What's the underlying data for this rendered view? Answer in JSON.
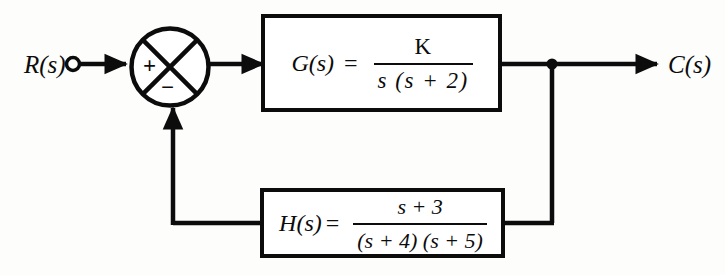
{
  "diagram": {
    "type": "control-system-block-diagram",
    "background_color": "#fdfdfc",
    "line_color": "#0c0c0c"
  },
  "input": {
    "label": "R(s)",
    "terminal": "open-circle"
  },
  "output": {
    "label": "C(s)",
    "terminal": "arrow"
  },
  "summing_junction": {
    "name": "summing-junction",
    "shape": "circle-with-x-cross",
    "forward_sign": "+",
    "feedback_sign": "−"
  },
  "forward_block": {
    "name": "G(s)",
    "function_label": "G(s)",
    "equals": "=",
    "numerator": "K",
    "denominator": "s (s + 2)",
    "expression": "G(s) = K / (s (s + 2))"
  },
  "feedback_block": {
    "name": "H(s)",
    "function_label": "H(s)",
    "equals": "=",
    "numerator": "s + 3",
    "denominator": "(s + 4) (s + 5)",
    "expression": "H(s) = (s + 3) / ((s + 4) (s + 5))"
  },
  "takeoff_point": {
    "name": "output-takeoff-node",
    "shape": "filled-dot"
  }
}
